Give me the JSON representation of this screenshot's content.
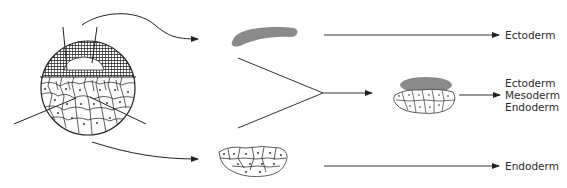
{
  "diagram": {
    "colors": {
      "stroke": "#222222",
      "cap": "#8a8a8a",
      "hatch": "#1e1e1e"
    },
    "outcomes": [
      {
        "id": "animal-cap",
        "labels": [
          "Ectoderm"
        ]
      },
      {
        "id": "combined",
        "labels": [
          "Ectoderm",
          "Mesoderm",
          "Endoderm"
        ]
      },
      {
        "id": "vegetal",
        "labels": [
          "Endoderm"
        ]
      }
    ]
  }
}
